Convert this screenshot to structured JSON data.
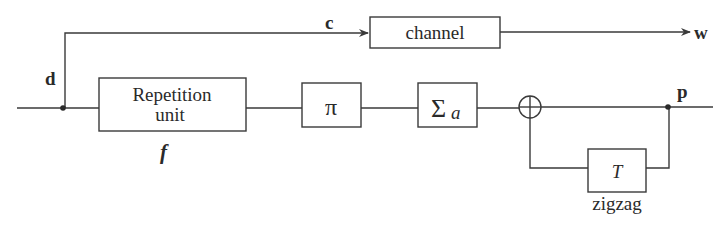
{
  "diagram": {
    "type": "block-diagram",
    "signals": {
      "input": "d",
      "systematic": "c",
      "output": "w",
      "parity": "p"
    },
    "blocks": {
      "repetition": {
        "line1": "Repetition",
        "line2": "unit",
        "sublabel": "f"
      },
      "interleaver": {
        "label": "π"
      },
      "accumulator": {
        "label": "Σ",
        "subscript": "a"
      },
      "adder": {
        "label": "⊕"
      },
      "delay": {
        "label": "T",
        "sublabel": "zigzag"
      },
      "channel": {
        "label": "channel"
      }
    },
    "colors": {
      "line": "#3a3a3a",
      "text": "#2a2a2a",
      "background": "#ffffff"
    }
  }
}
